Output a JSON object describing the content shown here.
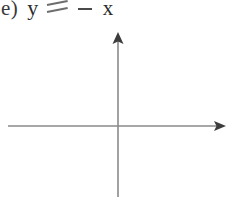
{
  "problem": {
    "label": "e)",
    "dependent_variable": "y",
    "relation_symbol": "=",
    "operator": "-",
    "independent_variable": "x",
    "equation_text": "e) y = - x"
  },
  "graph": {
    "type": "blank-coordinate-plane",
    "has_plotted_curve": false,
    "origin": {
      "x": 118,
      "y": 101
    },
    "x_axis": {
      "name": "horizontal-axis",
      "start_x": 8,
      "end_x": 226,
      "y": 101,
      "arrow_end": "right"
    },
    "y_axis": {
      "name": "vertical-axis",
      "x": 118,
      "start_y": 172,
      "end_y": 7,
      "arrow_end": "top"
    },
    "tick_marks": [],
    "axis_labels": [],
    "gridlines": false
  },
  "colors": {
    "background": "#ffffff",
    "axis_line": "#8a8a8a",
    "arrow_head": "#3d3d3d",
    "text": "#2e2e2e",
    "faded_symbol": "#6d6d6d"
  }
}
